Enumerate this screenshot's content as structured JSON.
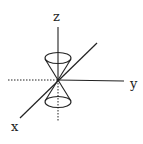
{
  "diagram": {
    "labels": {
      "z": "z",
      "y": "y",
      "x": "x"
    },
    "colors": {
      "stroke": "#222222",
      "background": "#ffffff"
    }
  }
}
